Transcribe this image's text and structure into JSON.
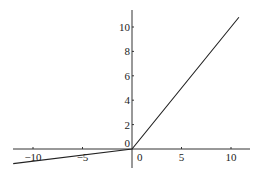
{
  "chart_data": {
    "type": "line",
    "title": "",
    "xlabel": "",
    "ylabel": "",
    "xlim": [
      -12,
      12
    ],
    "ylim": [
      -1.5,
      11
    ],
    "grid": false,
    "legend": null,
    "x_ticks": [
      -10,
      -5,
      0,
      5,
      10
    ],
    "x_tick_labels": [
      "−10",
      "−5",
      "0",
      "5",
      "10"
    ],
    "y_ticks": [
      0,
      2,
      4,
      6,
      8,
      10
    ],
    "y_tick_labels": [
      "0",
      "2",
      "4",
      "6",
      "8",
      "10"
    ],
    "series": [
      {
        "name": "leaky ReLU",
        "x": [
          -12,
          0,
          10.8
        ],
        "y": [
          -1.2,
          0,
          10.8
        ]
      }
    ],
    "annotations": []
  }
}
